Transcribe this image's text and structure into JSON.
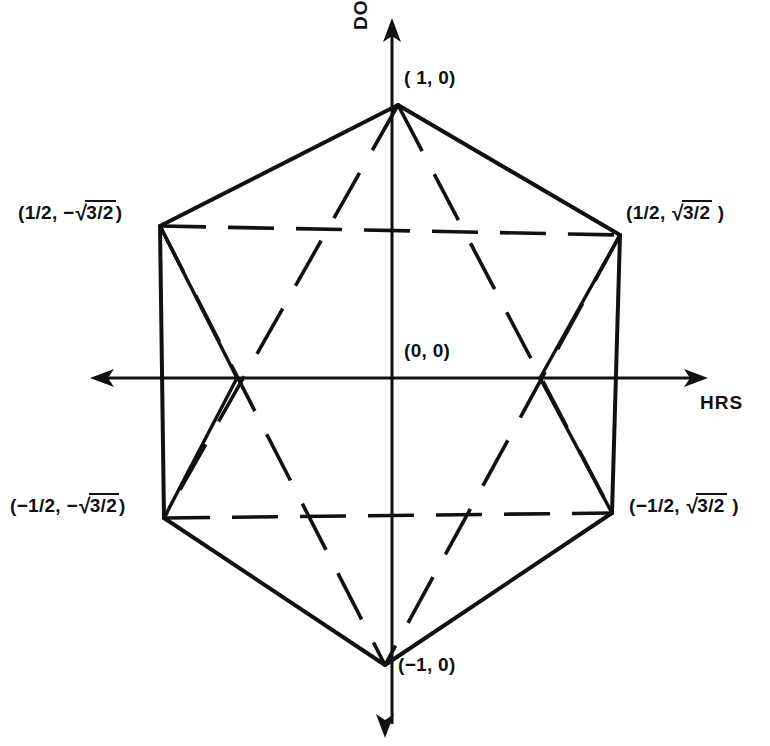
{
  "figure": {
    "kind": "hexagon-vertex-diagram",
    "title_visible": false,
    "stroke_color": "#111111",
    "background_color": "#ffffff"
  },
  "axes": {
    "vertical": {
      "name": "vertical-axis",
      "label": "DOSE",
      "orientation": "vertical",
      "arrow_at": "top",
      "top_px": 22,
      "bottom_px": 732,
      "x_px": 392
    },
    "horizontal": {
      "name": "horizontal-axis",
      "label": "HRS",
      "orientation": "horizontal",
      "arrow_at": "both",
      "left_px": 93,
      "right_px": 706,
      "y_px": 378
    }
  },
  "origin": {
    "label": "(0, 0)",
    "x_px": 392,
    "y_px": 378
  },
  "vertices": [
    {
      "id": "top",
      "label": "( 1, 0)",
      "x_px": 398,
      "y_px": 105
    },
    {
      "id": "upright",
      "label": "(1/2, √3/2 )",
      "x_px": 620,
      "y_px": 235
    },
    {
      "id": "lowright",
      "label": "(−1/2, √3/2 )",
      "x_px": 612,
      "y_px": 513
    },
    {
      "id": "bottom",
      "label": "(−1, 0)",
      "x_px": 385,
      "y_px": 665
    },
    {
      "id": "lowleft",
      "label": "(−1/2, −√3/2)",
      "x_px": 164,
      "y_px": 518
    },
    {
      "id": "upleft",
      "label": "(1/2, −√3/2)",
      "x_px": 160,
      "y_px": 226
    }
  ],
  "labels": {
    "top": {
      "text": "( 1, 0)"
    },
    "upper_left": {
      "prefix": "(1/2, ",
      "sign": "−",
      "radical_body": "3/2",
      "suffix": ")"
    },
    "upper_right": {
      "prefix": "(1/2, ",
      "sign": "",
      "radical_body": "3/2",
      "suffix": " )"
    },
    "lower_left": {
      "prefix": "(−1/2, ",
      "sign": "−",
      "radical_body": "3/2",
      "suffix": ")"
    },
    "lower_right": {
      "prefix": "(−1/2, ",
      "sign": "",
      "radical_body": "3/2",
      "suffix": " )"
    },
    "bottom": {
      "text": "(−1, 0)"
    },
    "origin": {
      "text": "(0, 0)"
    },
    "dose_axis": {
      "text": "DOSE"
    },
    "hrs_axis": {
      "text": "HRS"
    }
  },
  "edges": {
    "solid": [
      {
        "name": "hex-edge-top-to-upright",
        "from": "top",
        "to": "upright"
      },
      {
        "name": "hex-edge-upright-to-lowright",
        "from": "upright",
        "to": "lowright"
      },
      {
        "name": "hex-edge-lowright-to-bottom",
        "from": "lowright",
        "to": "bottom"
      },
      {
        "name": "hex-edge-bottom-to-lowleft",
        "from": "bottom",
        "to": "lowleft"
      },
      {
        "name": "hex-edge-lowleft-to-upleft",
        "from": "lowleft",
        "to": "upleft"
      },
      {
        "name": "hex-edge-upleft-to-top",
        "from": "upleft",
        "to": "top"
      },
      {
        "name": "chord-top-to-lowleft",
        "from": "top",
        "to": "lowleft"
      },
      {
        "name": "chord-top-to-lowright",
        "from": "top",
        "to": "lowright"
      },
      {
        "name": "chord-upleft-to-bottom",
        "from": "upleft",
        "to": "bottom"
      },
      {
        "name": "chord-upright-to-bottom",
        "from": "upright",
        "to": "bottom"
      }
    ],
    "dashed": [
      {
        "name": "dashed-upleft-to-upright",
        "from": "upleft",
        "to": "upright"
      },
      {
        "name": "dashed-lowleft-to-lowright",
        "from": "lowleft",
        "to": "lowright"
      },
      {
        "name": "dashed-top-to-lowleft",
        "from": "top",
        "to": "lowleft"
      },
      {
        "name": "dashed-top-to-lowright",
        "from": "top",
        "to": "lowright"
      },
      {
        "name": "dashed-upleft-to-bottom",
        "from": "upleft",
        "to": "bottom"
      },
      {
        "name": "dashed-upright-to-bottom",
        "from": "upright",
        "to": "bottom"
      }
    ]
  }
}
